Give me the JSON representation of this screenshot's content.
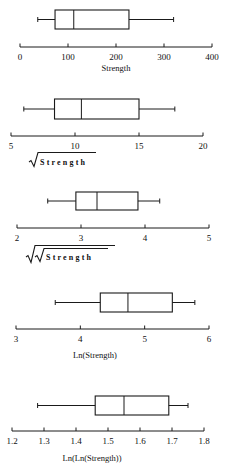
{
  "figure": {
    "background": "#ffffff",
    "line_color": "#1a1a1a"
  },
  "chart_data": [
    {
      "type": "boxplot",
      "title": "",
      "xlabel": "Strength",
      "xlabel_style": "plain",
      "xlim": [
        0,
        400
      ],
      "ticks": [
        0,
        100,
        200,
        300,
        400
      ],
      "tick_labels": [
        "0",
        "100",
        "200",
        "300",
        "400"
      ],
      "box": {
        "whisker_low": 37,
        "q1": 73,
        "median": 112,
        "q3": 227,
        "whisker_high": 320
      },
      "layout": {
        "px_min": 20,
        "px_max": 212,
        "box_top": 10,
        "box_bottom": 29,
        "axis_y": 47,
        "tick_label_y": 60,
        "xlabel_y": 71,
        "xlabel_x": 116
      }
    },
    {
      "type": "boxplot",
      "title": "",
      "xlabel": "Strength",
      "xlabel_style": "sqrt",
      "xlabel_display": "√Strength",
      "xlim": [
        5,
        20
      ],
      "ticks": [
        5,
        10,
        15,
        20
      ],
      "tick_labels": [
        "5",
        "10",
        "15",
        "20"
      ],
      "box": {
        "whisker_low": 6.0,
        "q1": 8.4,
        "median": 10.5,
        "q3": 15.0,
        "whisker_high": 17.8
      },
      "layout": {
        "px_min": 11,
        "px_max": 203,
        "box_top": 99,
        "box_bottom": 119,
        "axis_y": 136,
        "tick_label_y": 149,
        "xlabel_y": 165,
        "xlabel_x": 52
      }
    },
    {
      "type": "boxplot",
      "title": "",
      "xlabel": "Strength",
      "xlabel_style": "fourth-root",
      "xlabel_display": "√√Strength",
      "xlim": [
        2,
        5
      ],
      "ticks": [
        2,
        3,
        4,
        5
      ],
      "tick_labels": [
        "2",
        "3",
        "4",
        "5"
      ],
      "box": {
        "whisker_low": 2.48,
        "q1": 2.92,
        "median": 3.25,
        "q3": 3.89,
        "whisker_high": 4.23
      },
      "layout": {
        "px_min": 17,
        "px_max": 209,
        "box_top": 192,
        "box_bottom": 210,
        "axis_y": 228,
        "tick_label_y": 241,
        "xlabel_y": 260,
        "xlabel_x": 56
      }
    },
    {
      "type": "boxplot",
      "title": "",
      "xlabel": "Ln(Strength)",
      "xlabel_style": "plain",
      "xlim": [
        3,
        6
      ],
      "ticks": [
        3,
        4,
        5,
        6
      ],
      "tick_labels": [
        "3",
        "4",
        "5",
        "6"
      ],
      "box": {
        "whisker_low": 3.61,
        "q1": 4.31,
        "median": 4.74,
        "q3": 5.43,
        "whisker_high": 5.78
      },
      "layout": {
        "px_min": 16,
        "px_max": 209,
        "box_top": 293,
        "box_bottom": 312,
        "axis_y": 329,
        "tick_label_y": 342,
        "xlabel_y": 358,
        "xlabel_x": 95
      }
    },
    {
      "type": "boxplot",
      "title": "",
      "xlabel": "Ln(Ln(Strength))",
      "xlabel_style": "plain",
      "xlim": [
        1.2,
        1.8
      ],
      "ticks": [
        1.2,
        1.3,
        1.4,
        1.5,
        1.6,
        1.7,
        1.8
      ],
      "tick_labels": [
        "1.2",
        "1.3",
        "1.4",
        "1.5",
        "1.6",
        "1.7",
        "1.8"
      ],
      "box": {
        "whisker_low": 1.28,
        "q1": 1.46,
        "median": 1.55,
        "q3": 1.69,
        "whisker_high": 1.75
      },
      "layout": {
        "px_min": 12,
        "px_max": 204,
        "box_top": 396,
        "box_bottom": 415,
        "axis_y": 431,
        "tick_label_y": 444,
        "xlabel_y": 461,
        "xlabel_x": 92
      }
    }
  ]
}
